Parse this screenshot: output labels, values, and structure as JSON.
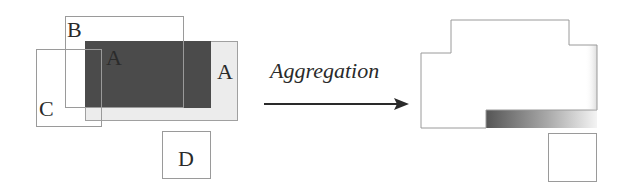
{
  "diagram": {
    "type": "region-aggregation",
    "left_panel": {
      "regions": [
        {
          "id": "A",
          "label": "A",
          "style": "dark-fill",
          "note": "overlap area of A (dark)"
        },
        {
          "id": "A2",
          "label": "A",
          "style": "light-fill"
        },
        {
          "id": "B",
          "label": "B",
          "style": "outline"
        },
        {
          "id": "C",
          "label": "C",
          "style": "outline"
        },
        {
          "id": "D",
          "label": "D",
          "style": "outline"
        }
      ]
    },
    "operation": {
      "label": "Aggregation",
      "arrow": "right-arrow"
    },
    "right_panel": {
      "shapes": [
        {
          "id": "merged-ABC",
          "style": "outline-with-gradient-edge"
        },
        {
          "id": "D",
          "style": "outline"
        }
      ],
      "gradient": {
        "from": "#555555",
        "to": "#ffffff"
      }
    },
    "colors": {
      "outline": "#9a9a9a",
      "dark_fill": "#4b4b4b",
      "light_fill": "#ececec",
      "text": "#2a2a2a"
    }
  }
}
